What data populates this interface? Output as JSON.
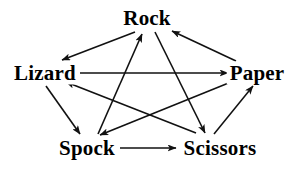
{
  "diagram": {
    "background_color": "#ffffff",
    "line_color": "#111111",
    "text_color": "#000000",
    "nodes": [
      {
        "id": "rock",
        "label": "Rock",
        "x": 147,
        "y": 18
      },
      {
        "id": "lizard",
        "label": "Lizard",
        "x": 45,
        "y": 73
      },
      {
        "id": "paper",
        "label": "Paper",
        "x": 257,
        "y": 73
      },
      {
        "id": "spock",
        "label": "Spock",
        "x": 87,
        "y": 148
      },
      {
        "id": "scissors",
        "label": "Scissors",
        "x": 220,
        "y": 148
      }
    ],
    "edges": [
      {
        "id": "rock-crushes-lizard",
        "from": "Rock",
        "to": "Lizard",
        "x1": 135,
        "y1": 32,
        "x2": 62,
        "y2": 60
      },
      {
        "id": "rock-crushes-scissors",
        "from": "Rock",
        "to": "Scissors",
        "x1": 155,
        "y1": 32,
        "x2": 205,
        "y2": 133
      },
      {
        "id": "paper-covers-rock",
        "from": "Paper",
        "to": "Rock",
        "x1": 236,
        "y1": 61,
        "x2": 172,
        "y2": 31
      },
      {
        "id": "paper-disproves-spock",
        "from": "Paper",
        "to": "Spock",
        "x1": 236,
        "y1": 80,
        "x2": 100,
        "y2": 135
      },
      {
        "id": "scissors-cuts-paper",
        "from": "Scissors",
        "to": "Paper",
        "x1": 214,
        "y1": 134,
        "x2": 253,
        "y2": 86
      },
      {
        "id": "scissors-decapitates-lizard",
        "from": "Scissors",
        "to": "Lizard",
        "x1": 196,
        "y1": 133,
        "x2": 66,
        "y2": 82
      },
      {
        "id": "lizard-poisons-spock",
        "from": "Lizard",
        "to": "Spock",
        "x1": 46,
        "y1": 86,
        "x2": 80,
        "y2": 134
      },
      {
        "id": "lizard-eats-paper",
        "from": "Lizard",
        "to": "Paper",
        "x1": 80,
        "y1": 73,
        "x2": 228,
        "y2": 73
      },
      {
        "id": "spock-smashes-scissors",
        "from": "Spock",
        "to": "Scissors",
        "x1": 120,
        "y1": 148,
        "x2": 176,
        "y2": 148
      },
      {
        "id": "spock-vaporizes-rock",
        "from": "Spock",
        "to": "Rock",
        "x1": 98,
        "y1": 134,
        "x2": 142,
        "y2": 34
      }
    ]
  }
}
